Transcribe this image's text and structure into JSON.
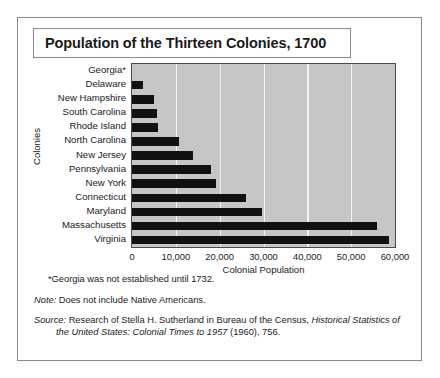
{
  "title": "Population of the Thirteen Colonies, 1700",
  "axis": {
    "ylabel": "Colonies",
    "xlabel": "Colonial Population"
  },
  "notes": {
    "georgia": "*Georgia was not established until 1732.",
    "note_label": "Note:",
    "note_text": " Does not include Native Americans.",
    "source_label": "Source:",
    "source_text_1": " Research of Stella H. Sutherland in Bureau of the Census, ",
    "source_italic_1": "Historical Statistics of",
    "source_italic_2": "the United States: Colonial Times to 1957",
    "source_text_2": " (1960), 756."
  },
  "chart_data": {
    "type": "bar",
    "orientation": "horizontal",
    "title": "Population of the Thirteen Colonies, 1700",
    "xlabel": "Colonial Population",
    "ylabel": "Colonies",
    "xlim": [
      0,
      60000
    ],
    "xticks": [
      0,
      10000,
      20000,
      30000,
      40000,
      50000,
      60000
    ],
    "xticklabels": [
      "0",
      "10,000",
      "20,000",
      "30,000",
      "40,000",
      "50,000",
      "60,000"
    ],
    "grid": "vertical",
    "legend": "none",
    "bar_color": "#111111",
    "plot_background": "#c6c6c6",
    "categories": [
      "Georgia*",
      "Delaware",
      "New Hampshire",
      "South Carolina",
      "Rhode Island",
      "North Carolina",
      "New Jersey",
      "Pennsylvania",
      "New York",
      "Connecticut",
      "Maryland",
      "Massachusetts",
      "Virginia"
    ],
    "values": [
      0,
      2500,
      5000,
      5700,
      5900,
      10700,
      14000,
      18000,
      19100,
      26000,
      29600,
      55900,
      58600
    ]
  }
}
